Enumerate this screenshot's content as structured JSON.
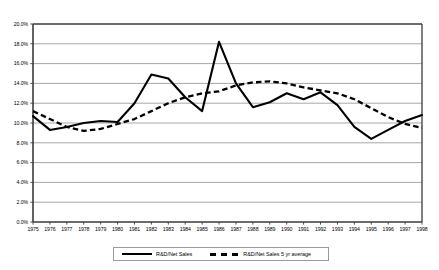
{
  "chart_data": {
    "type": "line",
    "title": "",
    "subtitle": "",
    "xlabel": "",
    "ylabel": "",
    "grid": true,
    "legend_position": "bottom",
    "ylim": [
      0,
      20
    ],
    "ytick_labels": [
      "20.0%",
      "18.0%",
      "16.0%",
      "14.0%",
      "12.0%",
      "10.0%",
      "8.0%",
      "6.0%",
      "4.0%",
      "2.0%",
      "0.0%"
    ],
    "ytick_values": [
      20,
      18,
      16,
      14,
      12,
      10,
      8,
      6,
      4,
      2,
      0
    ],
    "categories": [
      "1975",
      "1976",
      "1977",
      "1978",
      "1979",
      "1980",
      "1981",
      "1982",
      "1983",
      "1984",
      "1985",
      "1986",
      "1987",
      "1988",
      "1989",
      "1990",
      "1991",
      "1992",
      "1993",
      "1994",
      "1995",
      "1996",
      "1997",
      "1998"
    ],
    "series": [
      {
        "name": "R&D/Net Sales",
        "style": "solid",
        "color": "#000000",
        "values": [
          10.7,
          9.3,
          9.6,
          10.0,
          10.2,
          10.1,
          12.0,
          14.9,
          14.5,
          12.6,
          11.2,
          18.2,
          14.0,
          11.6,
          12.1,
          13.0,
          12.4,
          13.1,
          11.8,
          9.6,
          8.4,
          9.3,
          10.2,
          10.8
        ]
      },
      {
        "name": "R&D/Net Sales 5 yr average",
        "style": "dashed",
        "color": "#000000",
        "values": [
          11.2,
          10.4,
          9.6,
          9.2,
          9.4,
          9.9,
          10.4,
          11.2,
          12.0,
          12.6,
          13.0,
          13.2,
          13.8,
          14.1,
          14.2,
          14.0,
          13.6,
          13.3,
          13.0,
          12.4,
          11.5,
          10.6,
          9.9,
          9.5
        ]
      }
    ]
  },
  "legend": {
    "entries": [
      {
        "label": "R&D/Net Sales",
        "style": "solid"
      },
      {
        "label": "R&D/Net Sales 5 yr average",
        "style": "dashed"
      }
    ]
  }
}
